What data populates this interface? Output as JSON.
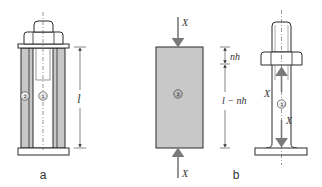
{
  "figure_a": {
    "label": "a",
    "part_labels": [
      "②",
      "①"
    ],
    "dimension_label": "l"
  },
  "figure_b": {
    "label": "b",
    "sleeve_label": "②",
    "bolt_label": "①",
    "force_label": "X",
    "dimension_top": "nh",
    "dimension_bottom": "l − nh"
  },
  "colors": {
    "stroke": "#2a2a2a",
    "fill_sleeve": "#c8c8c8",
    "fill_light": "#ffffff",
    "arrow": "#7a7a7a"
  }
}
